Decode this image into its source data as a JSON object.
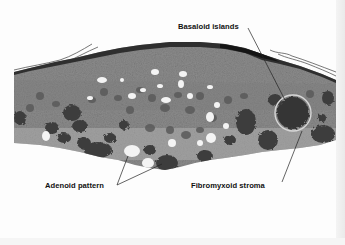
{
  "figure": {
    "type": "histology-micrograph",
    "stain": "grayscale",
    "labels": [
      {
        "id": "basaloid",
        "text": "Basaloid islands"
      },
      {
        "id": "adenoid",
        "text": "Adenoid pattern"
      },
      {
        "id": "fibromyxoid",
        "text": "Fibromyxoid stroma"
      }
    ]
  },
  "colors": {
    "background": "#fdfdfd",
    "tissue_base": "#8a8a8a",
    "tissue_dark": "#3a3a3a",
    "epidermis": "#2a2a2a",
    "label_text": "#111111",
    "leader_line": "#222222"
  }
}
